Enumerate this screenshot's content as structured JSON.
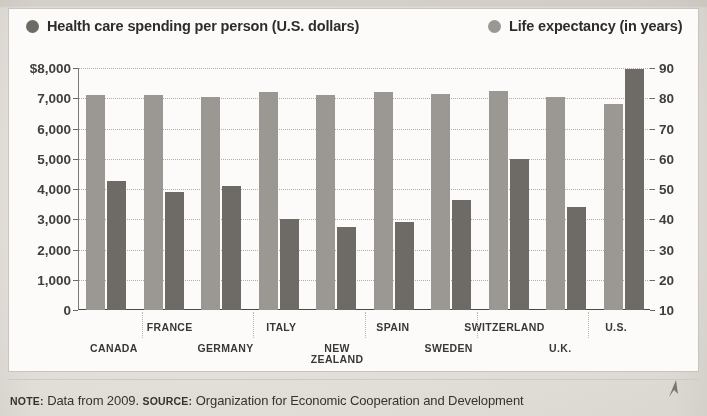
{
  "legend": {
    "spending": {
      "label": "Health care spending per person (U.S. dollars)",
      "color": "#6e6b67",
      "marker": "filled-circle"
    },
    "life": {
      "label": "Life expectancy (in years)",
      "color": "#9b9893",
      "marker": "filled-circle"
    }
  },
  "footnote": {
    "note_keyword": "NOTE:",
    "note_text": " Data from 2009. ",
    "source_keyword": "SOURCE:",
    "source_text": " Organization for Economic Cooperation and Development"
  },
  "chart_data": {
    "type": "bar",
    "title": "",
    "subtitle": "",
    "xlabel": "",
    "ylabel": "",
    "grid": true,
    "legend_position": "top",
    "categories": [
      "CANADA",
      "FRANCE",
      "GERMANY",
      "ITALY",
      "NEW ZEALAND",
      "SPAIN",
      "SWEDEN",
      "SWITZERLAND",
      "U.K.",
      "U.S."
    ],
    "series": [
      {
        "name": "Life expectancy (in years)",
        "axis": "right",
        "color": "#9b9893",
        "values": [
          81.0,
          81.2,
          80.3,
          82.0,
          81.0,
          82.0,
          81.4,
          82.3,
          80.4,
          78.2
        ]
      },
      {
        "name": "Health care spending per person (U.S. dollars)",
        "axis": "left",
        "color": "#6e6b67",
        "values": [
          4250,
          3900,
          4100,
          3000,
          2750,
          2900,
          3650,
          5000,
          3400,
          7960
        ]
      }
    ],
    "left_axis": {
      "label": "",
      "ticks": [
        "$8,000",
        "7,000",
        "6,000",
        "5,000",
        "4,000",
        "3,000",
        "2,000",
        "1,000",
        "0"
      ],
      "values": [
        8000,
        7000,
        6000,
        5000,
        4000,
        3000,
        2000,
        1000,
        0
      ],
      "ylim": [
        0,
        8000
      ]
    },
    "right_axis": {
      "label": "",
      "ticks": [
        "90",
        "80",
        "70",
        "60",
        "50",
        "40",
        "30",
        "20",
        "10"
      ],
      "values": [
        90,
        80,
        70,
        60,
        50,
        40,
        30,
        20,
        10
      ],
      "ylim": [
        10,
        90
      ]
    }
  }
}
